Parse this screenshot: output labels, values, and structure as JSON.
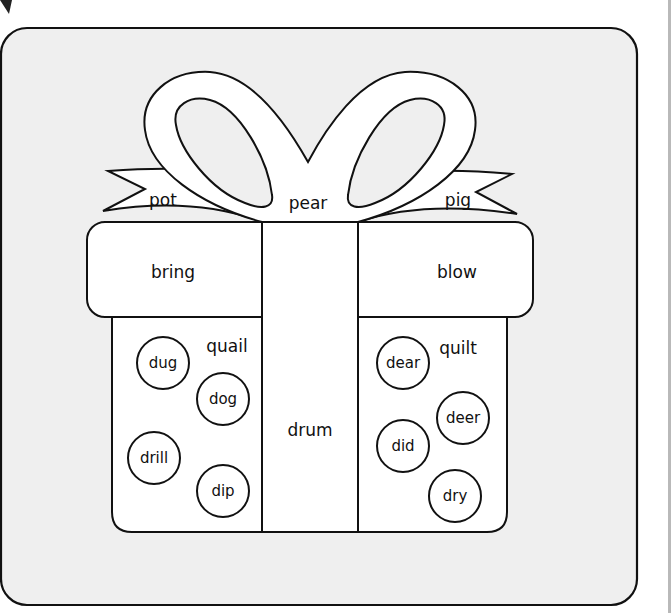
{
  "worksheet": {
    "title": "",
    "colors": {
      "panel_bg": "#efefef",
      "shape_fill": "#ffffff",
      "outline": "#111111",
      "edge_bar": "#b9b9b9"
    },
    "bow": {
      "tail_left": "pot",
      "knot": "pear",
      "tail_right": "pig"
    },
    "lid": {
      "left": "bring",
      "right": "blow"
    },
    "ribbon": {
      "center": "drum"
    },
    "body_left": {
      "label": "quail",
      "circles": [
        "dug",
        "dog",
        "drill",
        "dip"
      ]
    },
    "body_right": {
      "label": "quilt",
      "circles": [
        "dear",
        "deer",
        "did",
        "dry"
      ]
    }
  }
}
